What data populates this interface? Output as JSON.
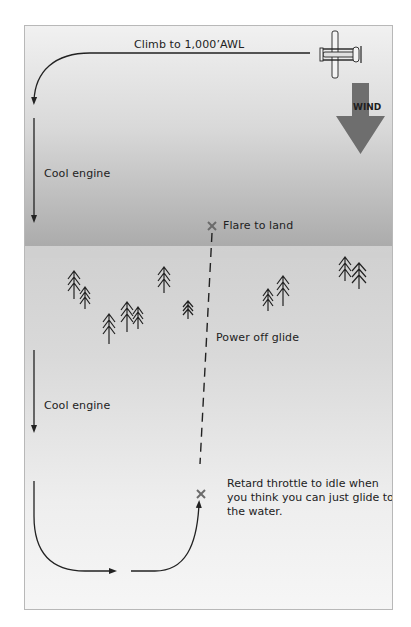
{
  "diagram": {
    "labels": {
      "climb": "Climb to 1,000’AWL",
      "cool_engine_top": "Cool engine",
      "flare": "Flare to land",
      "power_off": "Power off glide",
      "cool_engine_bottom": "Cool engine",
      "retard": "Retard throttle to idle when you think you can just glide to the water.",
      "wind": "WIND"
    },
    "colors": {
      "water_dark": "#a9a9a9",
      "water_light": "#f1f1f1",
      "land": "#d9d9d9",
      "wind_arrow": "#6e6e6e",
      "line": "#222222",
      "x_marker": "#6b6b6b"
    },
    "icons": [
      "airplane-icon",
      "wind-arrow-icon",
      "tree-icon",
      "x-marker-icon"
    ]
  }
}
